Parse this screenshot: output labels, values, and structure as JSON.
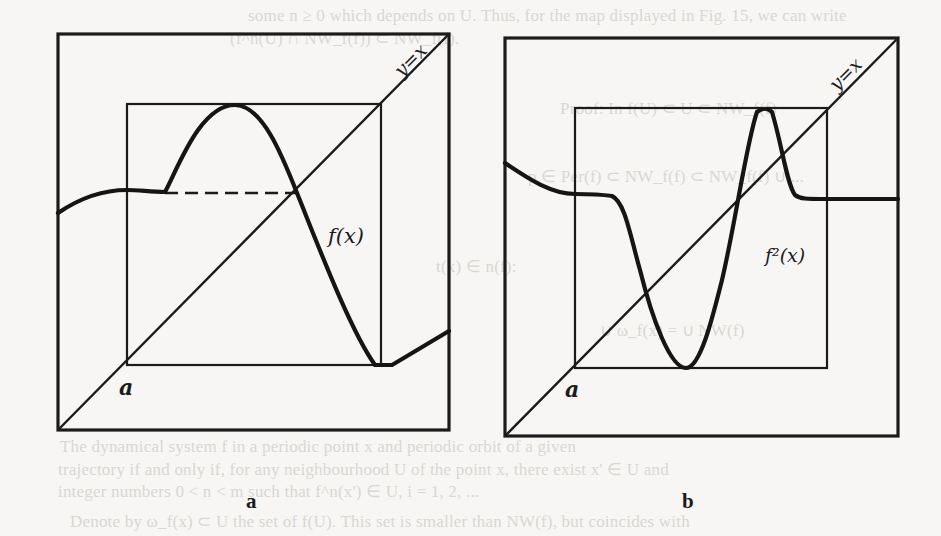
{
  "background_text": {
    "line1": "some  n ≥ 0  which depends on  U.  Thus, for the map displayed in Fig. 15, we can write",
    "line2": "(f^n(U) ∩ NW_f(f)) ⊂ NW_f(f).",
    "line3": "Proof: In f(U) ⊂ U ⊂ NW_f(f)",
    "line4": "p ∈ Per(f) ⊂ NW_f(f) ⊂ NW_f(f) ∪ ...",
    "line5": "t(x) ∈ n(f):",
    "line6": "∪ ω_f(x) = ∪ NW(f)",
    "line7": "The dynamical system f in a periodic point x and periodic orbit of a given",
    "line8": "trajectory if and only if, for any neighbourhood U of the point x, there exist x' ∈ U and",
    "line9": "integer numbers 0 < n < m such that f^n(x') ∈ U, i = 1, 2, ...",
    "line10": "Denote by ω_f(x) ⊂ U the set of f(U). This set is smaller than NW(f), but coincides with"
  },
  "figure": {
    "panels": [
      {
        "id": "a",
        "caption": "a",
        "diag_label": "y=x",
        "curve_label": "f(x)",
        "origin_label": "a",
        "outer_frame": {
          "x": 58,
          "y": 34,
          "w": 391,
          "h": 396
        },
        "inner_box": {
          "x": 127,
          "y": 104,
          "w": 254,
          "h": 261
        },
        "curve_path": "M58,213 C80,198 105,190 127,190 C140,190 150,192 165,192 C178,168 200,105 235,105 C262,105 282,155 297,193 C318,245 350,330 375,365 L392,365 L449,331",
        "dashed_level": {
          "x1": 165,
          "x2": 297,
          "y": 193
        },
        "note": "Curve exits the plateau and rises to a peak at the top of the inner box; dashed line marks the level of the fixed point on y=x."
      },
      {
        "id": "b",
        "caption": "b",
        "diag_label": "y=x",
        "curve_label": "f²(x)",
        "origin_label": "a",
        "outer_frame": {
          "x": 505,
          "y": 38,
          "w": 393,
          "h": 398
        },
        "inner_box": {
          "x": 575,
          "y": 108,
          "w": 252,
          "h": 260
        },
        "curve_path": "M505,163 C530,180 552,194 575,194 C592,194 605,195 612,196 C625,202 630,235 640,270 C652,318 670,368 686,368 C700,368 712,320 722,280 C735,225 747,140 757,112 C762,108 768,108 772,112 C782,145 787,185 795,195 C800,199 806,199 827,199 L898,199",
        "dashed_level": null
      }
    ]
  }
}
